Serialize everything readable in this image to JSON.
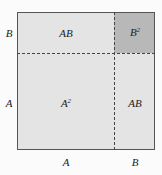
{
  "diagram": {
    "regions": {
      "top_left": "AB",
      "top_right_base": "B",
      "top_right_exp": "2",
      "bottom_left_base": "A",
      "bottom_left_exp": "2",
      "bottom_right": "AB"
    },
    "side_labels": {
      "left_top": "B",
      "left_bottom": "A"
    },
    "bottom_labels": {
      "left": "A",
      "right": "B"
    },
    "colors": {
      "square_fill": "#e4e4e4",
      "b2_fill": "#b8b8b8",
      "border": "#555555"
    }
  }
}
